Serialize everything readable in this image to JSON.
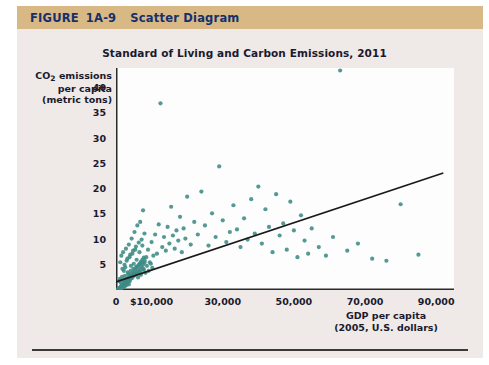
{
  "figure": {
    "label_word": "FIGURE",
    "number": "1A-9",
    "caption": "Scatter Diagram",
    "header_bg": "#d8b885",
    "header_text_color": "#15306b",
    "paper_bg": "#efe9e7"
  },
  "chart_data": {
    "type": "scatter",
    "title": "Standard of Living and Carbon Emissions, 2011",
    "xlabel": "GDP per capita",
    "xlabel_sub": "(2005, U.S. dollars)",
    "ylabel_line1": "CO2 emissions",
    "ylabel_line2": "per capita",
    "ylabel_line3": "(metric tons)",
    "xlim": [
      0,
      95000
    ],
    "ylim": [
      0,
      44
    ],
    "grid": false,
    "legend": "none",
    "point_color": "#3d8b85",
    "trendline_color": "#1a1a1a",
    "xticks": [
      0,
      10000,
      30000,
      50000,
      70000,
      90000
    ],
    "xtick_labels": [
      "0",
      "$10,000",
      "30,000",
      "50,000",
      "70,000",
      "90,000"
    ],
    "yticks": [
      5,
      10,
      15,
      20,
      25,
      30,
      35,
      40
    ],
    "ytick_labels": [
      "5",
      "10",
      "15",
      "20",
      "25",
      "30",
      "35",
      "40"
    ],
    "trendline": {
      "x0": 0,
      "y0": 1.6,
      "x1": 92000,
      "y1": 23.2
    },
    "points": [
      [
        600,
        0.2
      ],
      [
        700,
        0.3
      ],
      [
        800,
        0.1
      ],
      [
        900,
        0.4
      ],
      [
        1000,
        0.2
      ],
      [
        1100,
        0.5
      ],
      [
        1200,
        0.3
      ],
      [
        1300,
        0.6
      ],
      [
        1400,
        0.2
      ],
      [
        1500,
        0.8
      ],
      [
        1600,
        0.4
      ],
      [
        1700,
        1.0
      ],
      [
        1800,
        0.5
      ],
      [
        1900,
        0.7
      ],
      [
        2000,
        1.2
      ],
      [
        2100,
        0.6
      ],
      [
        2200,
        1.4
      ],
      [
        2300,
        0.9
      ],
      [
        2400,
        1.1
      ],
      [
        2500,
        1.6
      ],
      [
        2600,
        0.8
      ],
      [
        2700,
        1.3
      ],
      [
        2800,
        1.8
      ],
      [
        2900,
        1.0
      ],
      [
        3000,
        2.0
      ],
      [
        3100,
        1.2
      ],
      [
        3200,
        2.2
      ],
      [
        3300,
        1.5
      ],
      [
        3400,
        1.9
      ],
      [
        3500,
        2.5
      ],
      [
        3600,
        1.1
      ],
      [
        3700,
        2.3
      ],
      [
        3800,
        1.7
      ],
      [
        3900,
        2.8
      ],
      [
        4000,
        2.1
      ],
      [
        4200,
        3.0
      ],
      [
        4400,
        2.4
      ],
      [
        4600,
        3.3
      ],
      [
        4800,
        2.7
      ],
      [
        5000,
        3.6
      ],
      [
        5200,
        2.9
      ],
      [
        5400,
        4.0
      ],
      [
        5600,
        3.2
      ],
      [
        5800,
        4.4
      ],
      [
        6000,
        3.5
      ],
      [
        6200,
        4.8
      ],
      [
        6400,
        3.8
      ],
      [
        6600,
        5.2
      ],
      [
        6800,
        4.2
      ],
      [
        7000,
        5.6
      ],
      [
        7200,
        4.6
      ],
      [
        7400,
        6.0
      ],
      [
        7600,
        5.0
      ],
      [
        7800,
        6.4
      ],
      [
        8000,
        5.4
      ],
      [
        1200,
        5.5
      ],
      [
        1500,
        6.8
      ],
      [
        1800,
        4.2
      ],
      [
        2000,
        7.5
      ],
      [
        2400,
        5.0
      ],
      [
        2800,
        8.2
      ],
      [
        3200,
        6.2
      ],
      [
        3600,
        9.0
      ],
      [
        4000,
        7.0
      ],
      [
        4400,
        10.2
      ],
      [
        4800,
        7.8
      ],
      [
        5200,
        11.5
      ],
      [
        5600,
        8.6
      ],
      [
        6000,
        12.8
      ],
      [
        6400,
        9.4
      ],
      [
        6800,
        13.5
      ],
      [
        7200,
        10.0
      ],
      [
        7600,
        15.8
      ],
      [
        8000,
        11.2
      ],
      [
        8500,
        6.5
      ],
      [
        9000,
        8.0
      ],
      [
        9500,
        5.5
      ],
      [
        10000,
        9.5
      ],
      [
        10500,
        6.8
      ],
      [
        11000,
        11.0
      ],
      [
        11500,
        7.2
      ],
      [
        12000,
        13.0
      ],
      [
        12500,
        37.0
      ],
      [
        13000,
        8.5
      ],
      [
        13500,
        10.5
      ],
      [
        14000,
        7.8
      ],
      [
        14500,
        12.5
      ],
      [
        15000,
        9.2
      ],
      [
        15500,
        16.5
      ],
      [
        16000,
        10.8
      ],
      [
        16500,
        8.2
      ],
      [
        17000,
        11.8
      ],
      [
        17500,
        9.8
      ],
      [
        18000,
        14.5
      ],
      [
        18500,
        7.5
      ],
      [
        19000,
        12.2
      ],
      [
        19500,
        10.2
      ],
      [
        20000,
        18.5
      ],
      [
        21000,
        9.0
      ],
      [
        22000,
        13.5
      ],
      [
        23000,
        11.0
      ],
      [
        24000,
        19.5
      ],
      [
        25000,
        12.8
      ],
      [
        26000,
        8.8
      ],
      [
        27000,
        15.2
      ],
      [
        28000,
        10.5
      ],
      [
        29000,
        24.5
      ],
      [
        30000,
        13.8
      ],
      [
        31000,
        9.5
      ],
      [
        32000,
        11.5
      ],
      [
        33000,
        16.8
      ],
      [
        34000,
        12.0
      ],
      [
        35000,
        8.5
      ],
      [
        36000,
        14.2
      ],
      [
        37000,
        10.0
      ],
      [
        38000,
        18.0
      ],
      [
        39000,
        11.2
      ],
      [
        40000,
        20.5
      ],
      [
        41000,
        9.2
      ],
      [
        42000,
        16.0
      ],
      [
        43000,
        12.5
      ],
      [
        44000,
        7.5
      ],
      [
        45000,
        19.0
      ],
      [
        46000,
        10.8
      ],
      [
        47000,
        13.2
      ],
      [
        48000,
        8.0
      ],
      [
        49000,
        17.5
      ],
      [
        50000,
        11.8
      ],
      [
        51000,
        6.5
      ],
      [
        52000,
        14.8
      ],
      [
        53000,
        9.8
      ],
      [
        54000,
        7.2
      ],
      [
        55000,
        12.2
      ],
      [
        57000,
        8.5
      ],
      [
        59000,
        6.8
      ],
      [
        61000,
        10.5
      ],
      [
        63000,
        43.5
      ],
      [
        65000,
        7.8
      ],
      [
        68000,
        9.2
      ],
      [
        72000,
        6.2
      ],
      [
        76000,
        5.8
      ],
      [
        80000,
        17.0
      ],
      [
        85000,
        7.0
      ],
      [
        2200,
        3.8
      ],
      [
        2600,
        4.5
      ],
      [
        3000,
        5.8
      ],
      [
        3400,
        3.2
      ],
      [
        3800,
        6.5
      ],
      [
        4200,
        4.8
      ],
      [
        4600,
        7.2
      ],
      [
        5000,
        5.2
      ],
      [
        5400,
        8.0
      ],
      [
        5800,
        6.0
      ],
      [
        6200,
        2.5
      ],
      [
        6600,
        7.5
      ],
      [
        7000,
        3.0
      ],
      [
        7400,
        8.8
      ],
      [
        7800,
        4.0
      ],
      [
        900,
        1.8
      ],
      [
        1100,
        2.2
      ],
      [
        1300,
        1.5
      ],
      [
        1700,
        2.6
      ],
      [
        2100,
        2.0
      ],
      [
        2500,
        2.8
      ],
      [
        2900,
        2.2
      ],
      [
        3300,
        3.5
      ],
      [
        3700,
        2.6
      ],
      [
        4100,
        3.8
      ],
      [
        4500,
        2.4
      ],
      [
        4900,
        4.2
      ],
      [
        5300,
        3.0
      ],
      [
        5700,
        4.6
      ],
      [
        6100,
        3.4
      ],
      [
        6500,
        5.0
      ],
      [
        6900,
        3.6
      ],
      [
        7300,
        5.4
      ],
      [
        7700,
        4.2
      ],
      [
        8100,
        5.8
      ],
      [
        8300,
        3.4
      ],
      [
        8700,
        4.8
      ],
      [
        9200,
        3.8
      ],
      [
        9800,
        5.2
      ],
      [
        10200,
        4.4
      ]
    ]
  }
}
